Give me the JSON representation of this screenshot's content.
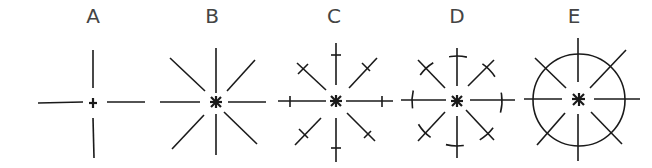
{
  "figures": [
    {
      "id": "A",
      "label": "A",
      "type": "cross",
      "center": [
        93,
        102
      ],
      "arm_length": 54,
      "gap": 6,
      "diagonals": false,
      "ticks": false,
      "circle": "none"
    },
    {
      "id": "B",
      "label": "B",
      "type": "eight-ray star",
      "center": [
        216,
        102
      ],
      "arm_length": 55,
      "gap": 7,
      "diagonals": true,
      "ticks": false,
      "circle": "none"
    },
    {
      "id": "C",
      "label": "C",
      "type": "eight-ray star with cross ticks",
      "center": [
        335,
        102
      ],
      "arm_length": 56,
      "gap": 7,
      "diagonals": true,
      "ticks": true,
      "circle": "none"
    },
    {
      "id": "D",
      "label": "D",
      "type": "eight-ray star with dashed circle",
      "center": [
        457,
        101
      ],
      "arm_length": 56,
      "gap": 7,
      "diagonals": true,
      "ticks": true,
      "circle": "dashed"
    },
    {
      "id": "E",
      "label": "E",
      "type": "eight-ray star with full circle",
      "center": [
        578,
        100
      ],
      "arm_length": 62,
      "gap": 8,
      "diagonals": true,
      "ticks": false,
      "circle": "solid"
    }
  ],
  "colors": {
    "line": "#1a1a1a",
    "label": "#444444",
    "background": "#ffffff"
  }
}
